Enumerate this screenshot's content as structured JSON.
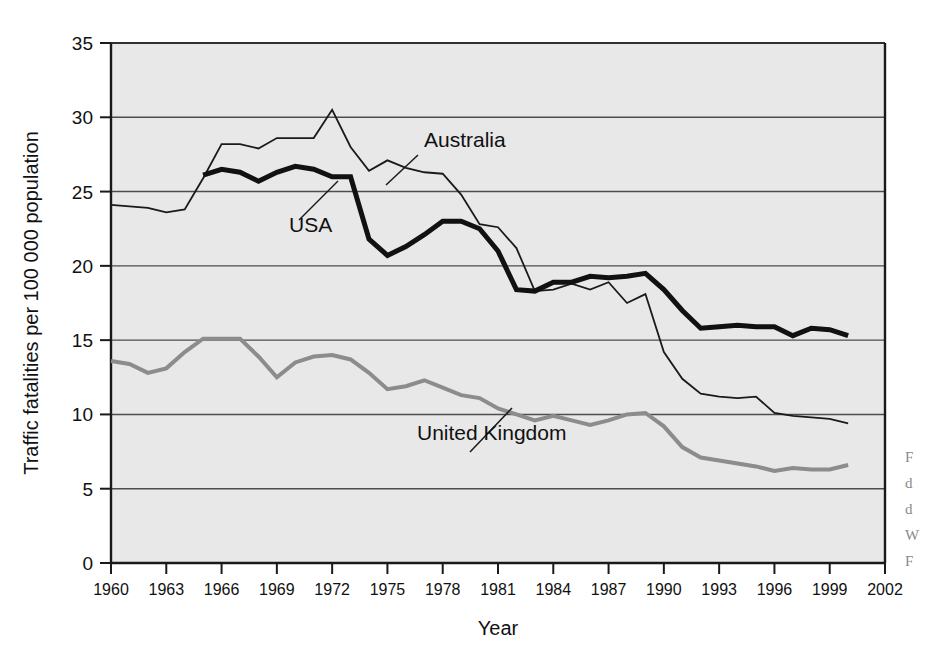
{
  "figure": {
    "background_color": "#ffffff",
    "plot_background_color": "#e8e8e8",
    "axis_color": "#1a1a1a",
    "gridline_color": "#4d4d4d"
  },
  "axes": {
    "y_title": "Traffic fatalities per 100 000 population",
    "x_title": "Year",
    "y_ticks": [
      "0",
      "5",
      "10",
      "15",
      "20",
      "25",
      "30",
      "35"
    ],
    "x_ticks": [
      "1960",
      "1963",
      "1966",
      "1969",
      "1972",
      "1975",
      "1978",
      "1981",
      "1984",
      "1987",
      "1990",
      "1993",
      "1996",
      "1999",
      "2002"
    ]
  },
  "annotations": [
    {
      "name": "australia",
      "label": "Australia",
      "x": 424,
      "y": 147
    },
    {
      "name": "usa",
      "label": "USA",
      "x": 289,
      "y": 232
    },
    {
      "name": "united-kingdom",
      "label": "United Kingdom",
      "x": 417,
      "y": 440
    }
  ],
  "caption_sliver": [
    "F",
    "d",
    "d",
    "W",
    "F"
  ],
  "chart_data": {
    "type": "line",
    "title": "",
    "xlabel": "Year",
    "ylabel": "Traffic fatalities per 100 000 population",
    "xlim": [
      1960,
      2002
    ],
    "ylim": [
      0,
      35
    ],
    "ytick_values": [
      0,
      5,
      10,
      15,
      20,
      25,
      30,
      35
    ],
    "xtick_values": [
      1960,
      1963,
      1966,
      1969,
      1972,
      1975,
      1978,
      1981,
      1984,
      1987,
      1990,
      1993,
      1996,
      1999,
      2002
    ],
    "grid": "horizontal",
    "legend": "inline-annotations",
    "series": [
      {
        "name": "Australia",
        "color": "#1a1a1a",
        "line_width": 1.8,
        "x": [
          1960,
          1961,
          1962,
          1963,
          1964,
          1965,
          1966,
          1967,
          1968,
          1969,
          1970,
          1971,
          1972,
          1973,
          1974,
          1975,
          1976,
          1977,
          1978,
          1979,
          1980,
          1981,
          1982,
          1983,
          1984,
          1985,
          1986,
          1987,
          1988,
          1989,
          1990,
          1991,
          1992,
          1993,
          1994,
          1995,
          1996,
          1997,
          1998,
          1999,
          2000
        ],
        "values": [
          24.1,
          24.0,
          23.9,
          23.6,
          23.8,
          25.9,
          28.2,
          28.2,
          27.9,
          28.6,
          28.6,
          28.6,
          30.5,
          28.0,
          26.4,
          27.1,
          26.6,
          26.3,
          26.2,
          24.8,
          22.8,
          22.6,
          21.2,
          18.3,
          18.4,
          18.8,
          18.4,
          18.9,
          17.5,
          18.1,
          14.2,
          12.4,
          11.4,
          11.2,
          11.1,
          11.2,
          10.1,
          9.9,
          9.8,
          9.7,
          9.4
        ]
      },
      {
        "name": "USA",
        "color": "#111111",
        "line_width": 5.0,
        "x": [
          1965,
          1966,
          1967,
          1968,
          1969,
          1970,
          1971,
          1972,
          1973,
          1974,
          1975,
          1976,
          1977,
          1978,
          1979,
          1980,
          1981,
          1982,
          1983,
          1984,
          1985,
          1986,
          1987,
          1988,
          1989,
          1990,
          1991,
          1992,
          1993,
          1994,
          1995,
          1996,
          1997,
          1998,
          1999,
          2000
        ],
        "values": [
          26.1,
          26.5,
          26.3,
          25.7,
          26.3,
          26.7,
          26.5,
          26.0,
          26.0,
          21.8,
          20.7,
          21.3,
          22.1,
          23.0,
          23.0,
          22.5,
          21.0,
          18.4,
          18.3,
          18.9,
          18.9,
          19.3,
          19.2,
          19.3,
          19.5,
          18.4,
          17.0,
          15.8,
          15.9,
          16.0,
          15.9,
          15.9,
          15.3,
          15.8,
          15.7,
          15.3
        ]
      },
      {
        "name": "United Kingdom",
        "color": "#8c8c8c",
        "line_width": 4.0,
        "x": [
          1960,
          1961,
          1962,
          1963,
          1964,
          1965,
          1966,
          1967,
          1968,
          1969,
          1970,
          1971,
          1972,
          1973,
          1974,
          1975,
          1976,
          1977,
          1978,
          1979,
          1980,
          1981,
          1982,
          1983,
          1984,
          1985,
          1986,
          1987,
          1988,
          1989,
          1990,
          1991,
          1992,
          1993,
          1994,
          1995,
          1996,
          1997,
          1998,
          1999,
          2000
        ],
        "values": [
          13.6,
          13.4,
          12.8,
          13.1,
          14.2,
          15.1,
          15.1,
          15.1,
          13.9,
          12.5,
          13.5,
          13.9,
          14.0,
          13.7,
          12.8,
          11.7,
          11.9,
          12.3,
          11.8,
          11.3,
          11.1,
          10.4,
          10.0,
          9.6,
          9.9,
          9.6,
          9.3,
          9.6,
          10.0,
          10.1,
          9.2,
          7.8,
          7.1,
          6.9,
          6.7,
          6.5,
          6.2,
          6.4,
          6.3,
          6.3,
          6.6
        ]
      }
    ]
  }
}
